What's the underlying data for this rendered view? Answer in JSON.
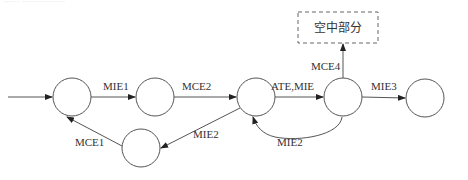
{
  "top_caption_fragment": "······ ·················",
  "states": [
    {
      "id": "s1",
      "cx": 72,
      "cy": 97,
      "r": 19
    },
    {
      "id": "s2",
      "cx": 155,
      "cy": 97,
      "r": 19
    },
    {
      "id": "s3",
      "cx": 256,
      "cy": 97,
      "r": 19
    },
    {
      "id": "s4",
      "cx": 343,
      "cy": 97,
      "r": 19
    },
    {
      "id": "s5",
      "cx": 425,
      "cy": 98,
      "r": 19
    },
    {
      "id": "s6",
      "cx": 141,
      "cy": 148,
      "r": 19
    }
  ],
  "external_box": {
    "label": "空中部分",
    "style": "dashed"
  },
  "transitions": [
    {
      "from": "start",
      "to": "s1",
      "label": ""
    },
    {
      "from": "s1",
      "to": "s2",
      "label": "MIE1"
    },
    {
      "from": "s2",
      "to": "s3",
      "label": "MCE2"
    },
    {
      "from": "s3",
      "to": "s4",
      "label": "ATE,MIE"
    },
    {
      "from": "s4",
      "to": "s5",
      "label": "MIE3"
    },
    {
      "from": "s4",
      "to": "external_box",
      "label": "MCE4"
    },
    {
      "from": "s4",
      "to": "s3",
      "label": "MIE2"
    },
    {
      "from": "s3",
      "to": "s6",
      "label": "MIE2"
    },
    {
      "from": "s6",
      "to": "s1",
      "label": "MCE1"
    }
  ]
}
